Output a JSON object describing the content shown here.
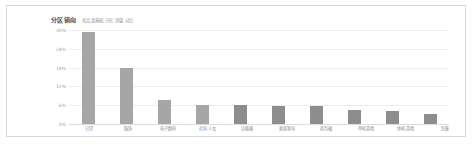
{
  "chart_data": {
    "type": "bar",
    "title": "分区销向",
    "subtitle": "各品类基础 分区 销量 对比",
    "xlabel": "",
    "ylabel": "",
    "ylim": [
      0,
      30
    ],
    "grid": true,
    "legend": "none",
    "yticks": [
      "0%",
      "6%",
      "12%",
      "18%",
      "24%",
      "30%"
    ],
    "ytick_values": [
      0,
      6,
      12,
      18,
      24,
      30
    ],
    "categories": [
      "日常",
      "服饰",
      "电子数码",
      "社科人文",
      "功能箱",
      "家居家电",
      "商务硬",
      "单机游戏",
      "体机游戏",
      "纺集"
    ],
    "values": [
      29.5,
      18.0,
      7.6,
      6.2,
      6.0,
      5.8,
      5.6,
      4.6,
      4.2,
      3.2
    ],
    "colors": {
      "bar_primary": "#a6a6a6",
      "bar_secondary": "#8d8d8d",
      "gridline": "#ececec",
      "baseline": "#dcdcdc",
      "axis_text": "#9e9e9e",
      "title_text": "#4a4a4a",
      "subtitle_text": "#9a9a9a",
      "card_border": "#d9d9d9",
      "background": "#ffffff"
    }
  }
}
